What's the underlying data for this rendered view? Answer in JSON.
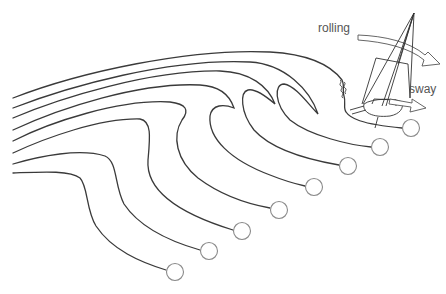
{
  "diagram": {
    "type": "wave-orbit-streamlines",
    "labels": {
      "rolling": "rolling",
      "sway": "sway"
    },
    "colors": {
      "line": "#3a3a3a",
      "particle_stroke": "#8a8a8a",
      "label": "#555555"
    },
    "particles": [
      {
        "x": 175,
        "y": 272
      },
      {
        "x": 209,
        "y": 251
      },
      {
        "x": 242,
        "y": 231
      },
      {
        "x": 279,
        "y": 210
      },
      {
        "x": 314,
        "y": 187
      },
      {
        "x": 348,
        "y": 166
      },
      {
        "x": 380,
        "y": 147
      },
      {
        "x": 411,
        "y": 128
      }
    ]
  }
}
